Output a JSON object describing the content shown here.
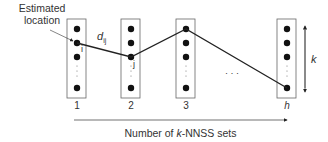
{
  "annotation": {
    "estimated_location_line1": "Estimated",
    "estimated_location_line2": "location"
  },
  "edge_label": {
    "base": "d",
    "subscript": "ij"
  },
  "node_labels": {
    "i": "i",
    "j": "j"
  },
  "sets": [
    {
      "label": "1"
    },
    {
      "label": "2"
    },
    {
      "label": "3"
    },
    {
      "label": "h"
    }
  ],
  "ellipsis": "· · ·",
  "k_axis": {
    "label": "k"
  },
  "x_axis": {
    "label_prefix": "Number of ",
    "label_italic": "k",
    "label_suffix": "-NNSS sets"
  },
  "colors": {
    "line": "#222222",
    "box": "#555555",
    "dot": "#111111",
    "text": "#333333"
  }
}
